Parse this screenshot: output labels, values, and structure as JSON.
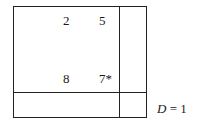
{
  "figure": {
    "cells": [
      {
        "row": 0,
        "col": 0,
        "value": "2"
      },
      {
        "row": 0,
        "col": 1,
        "value": "5"
      },
      {
        "row": 1,
        "col": 0,
        "value": "8"
      },
      {
        "row": 1,
        "col": 1,
        "value": "7*"
      }
    ],
    "label": {
      "variable": "D",
      "equals": " = ",
      "value": "1"
    }
  }
}
